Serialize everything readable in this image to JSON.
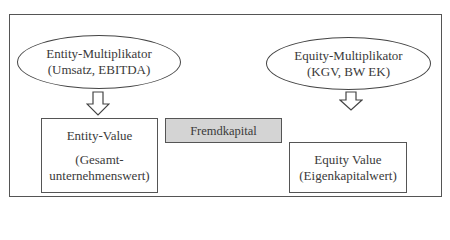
{
  "diagram": {
    "entity_multiplier": {
      "title": "Entity-Multiplikator",
      "subtitle": "(Umsatz, EBITDA)"
    },
    "equity_multiplier": {
      "title": "Equity-Multiplikator",
      "subtitle": "(KGV, BW EK)"
    },
    "entity_value": {
      "title": "Entity-Value",
      "subtitle_line1": "(Gesamt-",
      "subtitle_line2": "unternehmenswert)"
    },
    "debt": {
      "label": "Fremdkapital",
      "fill_color": "#d4d4d4"
    },
    "equity_value": {
      "title": "Equity Value",
      "subtitle": "(Eigenkapitalwert)"
    },
    "icons": [
      "arrow-down-icon",
      "arrow-down-icon"
    ]
  }
}
